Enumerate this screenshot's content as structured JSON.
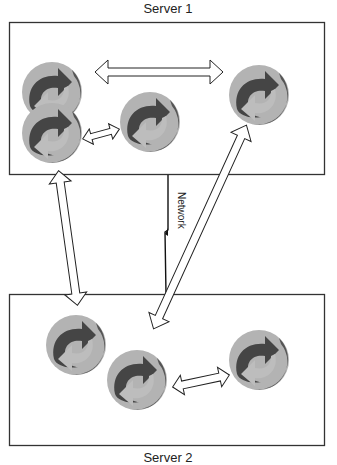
{
  "diagram": {
    "servers": [
      {
        "id": "server1",
        "label": "Server 1",
        "box": {
          "x": 9,
          "y": 22,
          "w": 316,
          "h": 153
        }
      },
      {
        "id": "server2",
        "label": "Server 2",
        "box": {
          "x": 9,
          "y": 294,
          "w": 316,
          "h": 152
        }
      }
    ],
    "network": {
      "label": "Network"
    },
    "processes": [
      {
        "id": "p1",
        "server": "server1",
        "cx": 52,
        "cy": 92
      },
      {
        "id": "p2",
        "server": "server1",
        "cx": 52,
        "cy": 133
      },
      {
        "id": "p3",
        "server": "server1",
        "cx": 150,
        "cy": 122
      },
      {
        "id": "p4",
        "server": "server1",
        "cx": 259,
        "cy": 95
      },
      {
        "id": "p5",
        "server": "server2",
        "cx": 76,
        "cy": 345
      },
      {
        "id": "p6",
        "server": "server2",
        "cx": 137,
        "cy": 380
      },
      {
        "id": "p7",
        "server": "server2",
        "cx": 259,
        "cy": 360
      }
    ],
    "connections": [
      {
        "from": "p1",
        "to": "p4",
        "type": "double-arrow"
      },
      {
        "from": "p2",
        "to": "p3",
        "type": "double-arrow"
      },
      {
        "from": "server1",
        "to": "server2",
        "type": "double-arrow"
      },
      {
        "from": "p4",
        "to": "p6",
        "type": "double-arrow"
      },
      {
        "from": "p6",
        "to": "p7",
        "type": "double-arrow"
      }
    ],
    "colors": {
      "process_light": "#b3b3b3",
      "process_dark": "#4a4a4a",
      "box_border": "#333333",
      "arrow_outline": "#222222"
    }
  }
}
